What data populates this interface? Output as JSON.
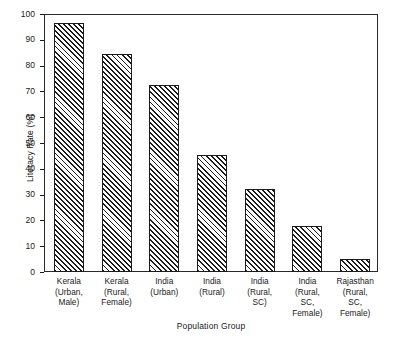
{
  "chart_data": {
    "type": "bar",
    "title": "",
    "xlabel": "Population Group",
    "ylabel": "Literacy Rate (%)",
    "ylim": [
      0,
      100
    ],
    "ytick_step": 10,
    "yticks": [
      100,
      90,
      80,
      70,
      60,
      50,
      40,
      30,
      20,
      10,
      0
    ],
    "ytick_labels": [
      "100",
      "90",
      "80",
      "70",
      "60",
      "50",
      "40",
      "30",
      "20",
      "10",
      "0"
    ],
    "grid": false,
    "legend": "none",
    "bar_style": "diagonal-hatch",
    "categories": [
      "Kerala (Urban, Male)",
      "Kerala (Rural, Female)",
      "India (Urban)",
      "India (Rural)",
      "India (Rural, SC)",
      "India (Rural, SC, Female)",
      "Rajasthan (Rural, SC, Female)"
    ],
    "category_lines": [
      [
        "Kerala",
        "(Urban,",
        "Male)"
      ],
      [
        "Kerala",
        "(Rural,",
        "Female)"
      ],
      [
        "India",
        "(Urban)"
      ],
      [
        "India",
        "(Rural)"
      ],
      [
        "India",
        "(Rural,",
        "SC)"
      ],
      [
        "India",
        "(Rural,",
        "SC,",
        "Female)"
      ],
      [
        "Rajasthan",
        "(Rural,",
        "SC,",
        "Female)"
      ]
    ],
    "values": [
      96.5,
      84.5,
      72.5,
      45.5,
      32,
      18,
      5
    ]
  },
  "colors": {
    "axis": "#1c1c1c",
    "bar_line": "#1b1b1b",
    "background": "#ffffff",
    "text": "#1a1a1a"
  }
}
